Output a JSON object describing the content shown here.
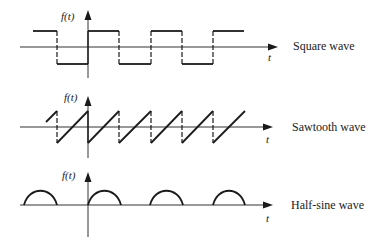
{
  "figure": {
    "background": "#ffffff",
    "ink_color": "#1a1a1a",
    "panels": [
      {
        "id": "square",
        "title": "Square wave",
        "y_label": "f(t)",
        "x_label": "t",
        "type": "square",
        "period_px": 62,
        "amplitude": "±1 (symmetric)"
      },
      {
        "id": "sawtooth",
        "title": "Sawtooth wave",
        "y_label": "f(t)",
        "x_label": "t",
        "type": "sawtooth",
        "period_px": 31,
        "amplitude": "ramps from -1 to +1 then drops"
      },
      {
        "id": "halfsine",
        "title": "Half-sine wave",
        "y_label": "f(t)",
        "x_label": "t",
        "type": "half-sine",
        "period_px": 62,
        "amplitude": "positive half-cycles, zero otherwise"
      }
    ]
  }
}
